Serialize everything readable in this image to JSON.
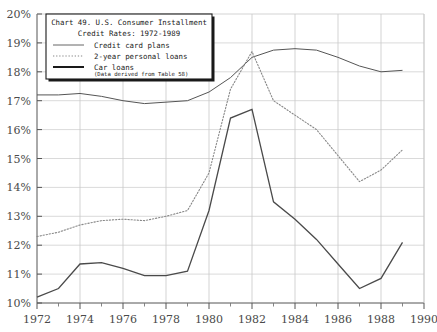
{
  "chart_data": {
    "type": "line",
    "title": "Chart 49. U.S. Consumer Installment",
    "title_line2": "Credit Rates: 1972-1989",
    "note": "(Data derived from Table 58)",
    "xlabel": "",
    "ylabel": "",
    "xlim": [
      1972,
      1990
    ],
    "ylim": [
      10,
      20
    ],
    "grid": true,
    "legend_position": "top-left",
    "y_ticks": [
      "10%",
      "11%",
      "12%",
      "13%",
      "14%",
      "15%",
      "16%",
      "17%",
      "18%",
      "19%",
      "20%"
    ],
    "y_tick_values": [
      10,
      11,
      12,
      13,
      14,
      15,
      16,
      17,
      18,
      19,
      20
    ],
    "x_ticks": [
      "1972",
      "1974",
      "1976",
      "1978",
      "1980",
      "1982",
      "1984",
      "1986",
      "1988",
      "1990"
    ],
    "x_tick_values": [
      1972,
      1974,
      1976,
      1978,
      1980,
      1982,
      1984,
      1986,
      1988,
      1990
    ],
    "x_minor_values": [
      1973,
      1975,
      1977,
      1979,
      1981,
      1983,
      1985,
      1987,
      1989
    ],
    "x": [
      1972,
      1973,
      1974,
      1975,
      1976,
      1977,
      1978,
      1979,
      1980,
      1981,
      1982,
      1983,
      1984,
      1985,
      1986,
      1987,
      1988,
      1989
    ],
    "series": [
      {
        "name": "Credit card plans",
        "style": "solid-thin",
        "color": "#555555",
        "values": [
          17.2,
          17.2,
          17.25,
          17.15,
          17.0,
          16.9,
          16.95,
          17.0,
          17.3,
          17.8,
          18.5,
          18.75,
          18.8,
          18.75,
          18.5,
          18.2,
          18.0,
          18.05
        ]
      },
      {
        "name": "2-year personal loans",
        "style": "dotted",
        "color": "#888888",
        "values": [
          12.3,
          12.45,
          12.7,
          12.85,
          12.9,
          12.85,
          13.0,
          13.2,
          14.5,
          17.4,
          18.7,
          17.0,
          16.5,
          16.0,
          15.1,
          14.2,
          14.6,
          15.3
        ]
      },
      {
        "name": "Car loans",
        "style": "solid-thick",
        "color": "#4a4a4a",
        "values": [
          10.2,
          10.5,
          11.35,
          11.4,
          11.2,
          10.95,
          10.95,
          11.1,
          13.2,
          16.4,
          16.7,
          13.5,
          12.9,
          12.2,
          11.35,
          10.5,
          10.85,
          12.1
        ]
      }
    ]
  },
  "legend": {
    "title_line1": "Chart 49. U.S. Consumer Installment",
    "title_line2": "Credit Rates: 1972-1989",
    "items": [
      {
        "label": "Credit card plans",
        "style": "solid-thin"
      },
      {
        "label": "2-year personal loans",
        "style": "dotted"
      },
      {
        "label": "Car loans",
        "style": "solid-thick"
      }
    ],
    "note": "(Data derived from Table 58)"
  }
}
